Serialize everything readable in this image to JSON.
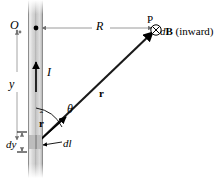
{
  "figure": {
    "background_color": "#ffffff",
    "line_color": "#000000",
    "dimension_line_color": "#9a9a9a",
    "wire_color_light": "#e8e8e8",
    "wire_color_mid": "#c2c2c2",
    "wire_color_edge": "#8d8d8d"
  },
  "labels": {
    "origin": "O",
    "distance_R": "R",
    "point_P": "P",
    "field_d": "d",
    "field_B": "B",
    "field_paren": "(inward)",
    "height_y": "y",
    "current_I": "I",
    "angle_theta": "θ",
    "vector_r": "r",
    "unit_vector_r": "r",
    "unit_vector_hat": "ˆ",
    "element_dy": "dy",
    "element_dl": "dl"
  },
  "icons": {
    "cross_in_circle": "⊗",
    "current_arrow": "up-arrow-icon",
    "field_into_page": "cross-in-circle-icon"
  },
  "geometry": {
    "wire_x_left": 28,
    "wire_x_right": 43,
    "origin_point": [
      36,
      28
    ],
    "point_P": [
      158,
      30
    ],
    "element_point": [
      36,
      143
    ],
    "r_line_from": [
      36,
      143
    ],
    "r_line_to": [
      154,
      32
    ],
    "R_line_from": [
      41,
      28
    ],
    "R_line_to": [
      154,
      28
    ],
    "y_line_x": 17,
    "y_line_from": 29,
    "y_line_to": 143,
    "theta_arc_radius": 34,
    "angle_theta_degrees": 43
  },
  "annotations": {
    "field_direction": "inward",
    "current_direction": "upward"
  }
}
